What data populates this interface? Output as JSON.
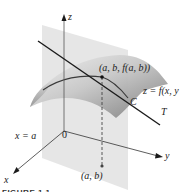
{
  "figure": {
    "labels": {
      "z_axis": "z",
      "y_axis": "y",
      "x_axis": "x",
      "origin": "0",
      "point_3d": "(a, b, f(a, b))",
      "surface": "z = f(x, y",
      "curve": "C",
      "tangent": "T",
      "plane": "x = a",
      "point_2d": "(a, b)"
    },
    "caption": "FIGURE 1.1",
    "colors": {
      "plane": "#d9d9d9",
      "surface_light": "#e6e6e6",
      "surface_dark": "#8a8a8a",
      "line": "#1a1a1a"
    }
  }
}
